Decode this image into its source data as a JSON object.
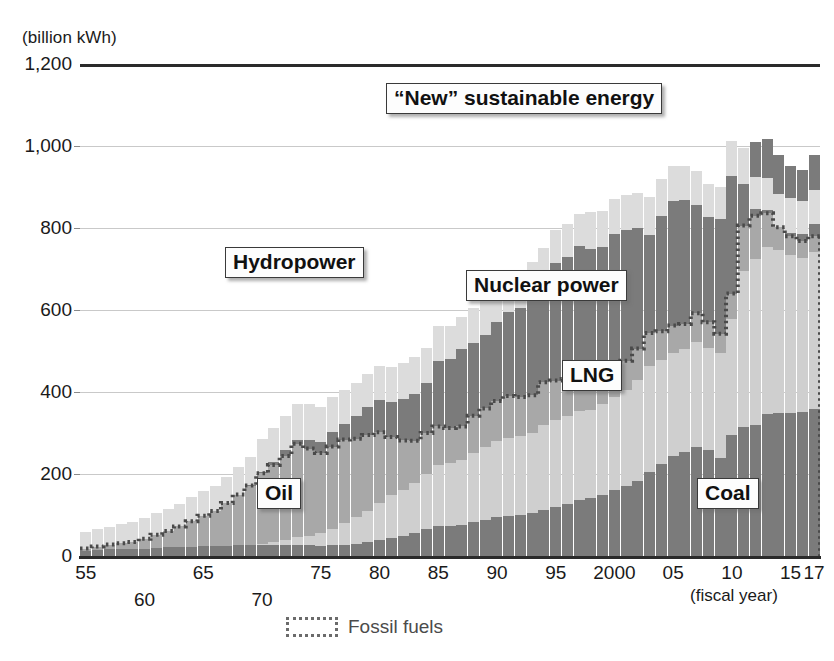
{
  "chart_data": {
    "type": "bar",
    "stacked": true,
    "title": "",
    "subtitle": "",
    "unit_label": "(billion kWh)",
    "xlabel": "(fiscal year)",
    "ylabel": "",
    "ylim": [
      0,
      1200
    ],
    "yticks": [
      0,
      200,
      400,
      600,
      800,
      1000,
      1200
    ],
    "ytick_labels": [
      "0",
      "200",
      "400",
      "600",
      "800",
      "1,000",
      "1,200"
    ],
    "grid": true,
    "legend_position": "bottom-center",
    "legend": [
      {
        "label": "Fossil fuels",
        "style": "dotted-outline",
        "color": "#6b6b6b"
      }
    ],
    "annotations": [
      {
        "text": "“New” sustainable energy",
        "x": 0.62,
        "y": 1085
      },
      {
        "text": "Hydropower",
        "x": 0.27,
        "y": 700
      },
      {
        "text": "Nuclear power",
        "x": 0.62,
        "y": 660
      },
      {
        "text": "LNG",
        "x": 0.7,
        "y": 440
      },
      {
        "text": "Oil",
        "x": 0.28,
        "y": 165
      },
      {
        "text": "Coal",
        "x": 0.88,
        "y": 160
      }
    ],
    "x": [
      "1955",
      "1956",
      "1957",
      "1958",
      "1959",
      "1960",
      "1961",
      "1962",
      "1963",
      "1964",
      "1965",
      "1966",
      "1967",
      "1968",
      "1969",
      "1970",
      "1971",
      "1972",
      "1973",
      "1974",
      "1975",
      "1976",
      "1977",
      "1978",
      "1979",
      "1980",
      "1981",
      "1982",
      "1983",
      "1984",
      "1985",
      "1986",
      "1987",
      "1988",
      "1989",
      "1990",
      "1991",
      "1992",
      "1993",
      "1994",
      "1995",
      "1996",
      "1997",
      "1998",
      "1999",
      "2000",
      "2001",
      "2002",
      "2003",
      "2004",
      "2005",
      "2006",
      "2007",
      "2008",
      "2009",
      "2010",
      "2011",
      "2012",
      "2013",
      "2014",
      "2015",
      "2016",
      "2017"
    ],
    "xtick_labels": [
      "55",
      "60",
      "65",
      "70",
      "75",
      "80",
      "85",
      "90",
      "95",
      "2000",
      "05",
      "10",
      "15",
      "17"
    ],
    "xtick_positions": [
      0,
      5,
      10,
      15,
      20,
      25,
      30,
      35,
      40,
      45,
      50,
      55,
      60,
      62
    ],
    "xtick_rows": [
      1,
      2,
      1,
      2,
      1,
      1,
      1,
      1,
      1,
      1,
      1,
      1,
      1,
      1
    ],
    "colors": {
      "coal": "#7b7b7b",
      "lng": "#cfcfcf",
      "oil": "#a8a8a8",
      "nuclear": "#7b7b7b",
      "hydro": "#dcdcdc",
      "new_sustainable": "#7b7b7b",
      "fossil_line": "#4a4a4a",
      "gridline": "#c9c9c9",
      "axis": "#2a2a2a"
    },
    "series": [
      {
        "name": "Coal",
        "key": "coal",
        "values": [
          12,
          14,
          16,
          17,
          16,
          18,
          20,
          21,
          22,
          23,
          24,
          24,
          25,
          26,
          26,
          27,
          27,
          28,
          28,
          26,
          25,
          27,
          28,
          30,
          33,
          38,
          44,
          50,
          57,
          66,
          74,
          74,
          76,
          82,
          88,
          94,
          98,
          100,
          104,
          112,
          120,
          128,
          136,
          142,
          150,
          160,
          170,
          182,
          206,
          224,
          244,
          254,
          266,
          258,
          240,
          294,
          314,
          320,
          346,
          348,
          350,
          352,
          358
        ]
      },
      {
        "name": "LNG",
        "key": "lng",
        "values": [
          0,
          0,
          0,
          0,
          0,
          0,
          0,
          0,
          0,
          0,
          0,
          0,
          0,
          0,
          0,
          3,
          7,
          12,
          18,
          22,
          30,
          40,
          52,
          64,
          78,
          92,
          104,
          112,
          120,
          134,
          148,
          152,
          158,
          170,
          178,
          186,
          190,
          192,
          196,
          208,
          212,
          214,
          218,
          214,
          220,
          228,
          234,
          248,
          258,
          254,
          252,
          250,
          256,
          250,
          254,
          284,
          382,
          404,
          408,
          398,
          384,
          376,
          384
        ]
      },
      {
        "name": "Oil",
        "key": "oil",
        "values": [
          6,
          9,
          12,
          14,
          18,
          24,
          32,
          40,
          50,
          62,
          74,
          86,
          104,
          124,
          146,
          172,
          188,
          204,
          228,
          214,
          196,
          200,
          204,
          192,
          184,
          172,
          142,
          120,
          104,
          100,
          94,
          86,
          82,
          90,
          94,
          98,
          102,
          96,
          92,
          104,
          96,
          90,
          84,
          74,
          72,
          76,
          72,
          76,
          80,
          70,
          66,
          62,
          70,
          62,
          48,
          62,
          110,
          106,
          82,
          56,
          46,
          40,
          38
        ]
      },
      {
        "name": "Nuclear power",
        "key": "nuclear",
        "values": [
          0,
          0,
          0,
          0,
          0,
          0,
          0,
          0,
          0,
          0,
          0,
          0,
          0,
          0,
          1,
          4,
          8,
          14,
          10,
          20,
          26,
          36,
          38,
          56,
          68,
          78,
          86,
          100,
          114,
          122,
          160,
          168,
          188,
          178,
          178,
          192,
          206,
          216,
          238,
          256,
          286,
          298,
          318,
          318,
          312,
          322,
          320,
          294,
          238,
          282,
          304,
          302,
          264,
          258,
          280,
          288,
          102,
          16,
          9,
          0,
          9,
          18,
          31
        ]
      },
      {
        "name": "Hydropower",
        "key": "hydro",
        "values": [
          40,
          42,
          44,
          46,
          48,
          50,
          52,
          54,
          56,
          58,
          60,
          62,
          64,
          66,
          68,
          80,
          82,
          84,
          86,
          88,
          86,
          84,
          82,
          80,
          82,
          84,
          86,
          88,
          90,
          86,
          84,
          82,
          80,
          86,
          88,
          90,
          92,
          88,
          86,
          72,
          82,
          80,
          78,
          92,
          88,
          86,
          84,
          86,
          94,
          90,
          86,
          84,
          82,
          80,
          78,
          84,
          86,
          78,
          76,
          82,
          84,
          80,
          82
        ]
      },
      {
        "name": "“New” sustainable energy",
        "key": "new_sustainable",
        "values": [
          0,
          0,
          0,
          0,
          0,
          0,
          0,
          0,
          0,
          0,
          0,
          0,
          0,
          0,
          0,
          0,
          0,
          0,
          0,
          0,
          0,
          0,
          0,
          0,
          0,
          0,
          0,
          0,
          0,
          0,
          0,
          0,
          0,
          0,
          0,
          0,
          0,
          0,
          0,
          0,
          0,
          0,
          0,
          0,
          0,
          0,
          0,
          0,
          0,
          0,
          0,
          0,
          0,
          0,
          0,
          0,
          0,
          86,
          96,
          94,
          78,
          76,
          86
        ]
      }
    ],
    "fossil_fuels_line": [
      18,
      23,
      28,
      31,
      34,
      42,
      52,
      61,
      72,
      85,
      98,
      110,
      129,
      150,
      172,
      202,
      222,
      244,
      274,
      262,
      251,
      267,
      284,
      286,
      295,
      302,
      290,
      282,
      281,
      300,
      316,
      312,
      316,
      342,
      360,
      378,
      390,
      388,
      392,
      424,
      428,
      432,
      438,
      430,
      442,
      464,
      476,
      506,
      544,
      548,
      562,
      566,
      592,
      570,
      542,
      640,
      806,
      830,
      836,
      802,
      780,
      768,
      780
    ]
  },
  "callouts": {
    "new_sustainable": "“New” sustainable energy",
    "hydropower": "Hydropower",
    "nuclear": "Nuclear power",
    "lng": "LNG",
    "oil": "Oil",
    "coal": "Coal"
  },
  "axis": {
    "unit": "(billion kWh)",
    "fiscal_year": "(fiscal year)"
  },
  "legend": {
    "fossil_fuels": "Fossil fuels"
  }
}
